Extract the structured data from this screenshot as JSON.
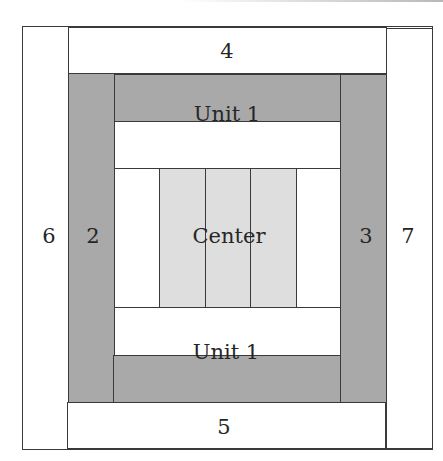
{
  "diagram": {
    "colors": {
      "outline": "#3a3a3a",
      "dark_fabric": "#a9a9a9",
      "light_fabric": "#dedede",
      "white_fabric": "#ffffff"
    },
    "pieces": {
      "strip_4": "4",
      "strip_5": "5",
      "strip_6": "6",
      "strip_7": "7",
      "strip_2": "2",
      "strip_3": "3",
      "unit_top": "Unit 1",
      "unit_bottom": "Unit 1",
      "center": "Center"
    },
    "center_strip_count": 3
  }
}
